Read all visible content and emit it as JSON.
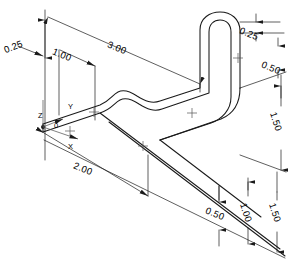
{
  "drawing": {
    "title": "Isometric bent tube dimensioned drawing",
    "units": "inches",
    "line_color": "#1a1a1a",
    "background_color": "#ffffff",
    "view": "isometric"
  },
  "axes": {
    "origin_label": "0",
    "x_label": "X",
    "y_label": "Y",
    "z_label": "Z"
  },
  "dimensions": {
    "top_left_offset": "0.25",
    "top_first_segment": "1.00",
    "top_overall": "3.00",
    "bottom_left_run": "2.00",
    "right_top_step": "0.25",
    "right_upper_height": "0.50",
    "right_mid_height": "1.50",
    "bottom_right_small": "0.50",
    "bottom_right_mid": "1.00",
    "bottom_right_large": "1.50"
  }
}
